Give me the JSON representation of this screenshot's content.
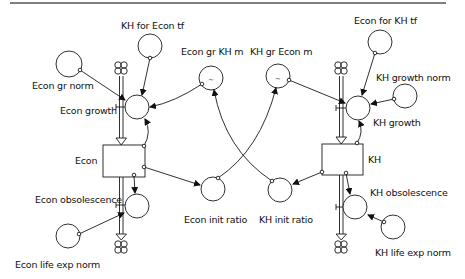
{
  "diagram": {
    "type": "stock-and-flow",
    "stocks": [
      {
        "id": "econ",
        "label": "Econ"
      },
      {
        "id": "kh",
        "label": "KH"
      }
    ],
    "flows": [
      {
        "id": "econ_growth",
        "label": "Econ growth",
        "into": "econ"
      },
      {
        "id": "econ_obsolescence",
        "label": "Econ obsolescence",
        "out_of": "econ"
      },
      {
        "id": "kh_growth",
        "label": "KH growth",
        "into": "kh"
      },
      {
        "id": "kh_obsolescence",
        "label": "KH obsolescence",
        "out_of": "kh"
      }
    ],
    "auxiliaries": [
      {
        "id": "kh_for_econ_tf",
        "label": "KH for Econ tf"
      },
      {
        "id": "econ_gr_norm",
        "label": "Econ gr norm"
      },
      {
        "id": "econ_gr_kh_m",
        "label": "Econ gr KH m",
        "lookup": true
      },
      {
        "id": "kh_gr_econ_m",
        "label": "KH gr Econ m",
        "lookup": true
      },
      {
        "id": "econ_for_kh_tf",
        "label": "Econ for KH tf"
      },
      {
        "id": "kh_growth_norm",
        "label": "KH growth norm"
      },
      {
        "id": "econ_init_ratio",
        "label": "Econ init ratio"
      },
      {
        "id": "kh_init_ratio",
        "label": "KH init ratio"
      },
      {
        "id": "econ_life_exp_norm",
        "label": "Econ life exp norm"
      },
      {
        "id": "kh_life_exp_norm",
        "label": "KH life exp norm"
      }
    ],
    "links": [
      [
        "kh_for_econ_tf",
        "econ_growth"
      ],
      [
        "econ_gr_norm",
        "econ_growth"
      ],
      [
        "econ_gr_kh_m",
        "econ_growth"
      ],
      [
        "econ",
        "econ_growth"
      ],
      [
        "econ",
        "econ_obsolescence"
      ],
      [
        "econ",
        "econ_init_ratio"
      ],
      [
        "econ_life_exp_norm",
        "econ_obsolescence"
      ],
      [
        "econ_init_ratio",
        "kh_gr_econ_m"
      ],
      [
        "kh_init_ratio",
        "econ_gr_kh_m"
      ],
      [
        "econ_for_kh_tf",
        "kh_growth"
      ],
      [
        "kh_growth_norm",
        "kh_growth"
      ],
      [
        "kh_gr_econ_m",
        "kh_growth"
      ],
      [
        "kh",
        "kh_growth"
      ],
      [
        "kh",
        "kh_obsolescence"
      ],
      [
        "kh",
        "kh_init_ratio"
      ],
      [
        "kh_life_exp_norm",
        "kh_obsolescence"
      ]
    ]
  },
  "colors": {
    "stroke": "#1a1a1a",
    "background": "#ffffff",
    "rule": "#555555"
  },
  "lookup_glyph": "~"
}
